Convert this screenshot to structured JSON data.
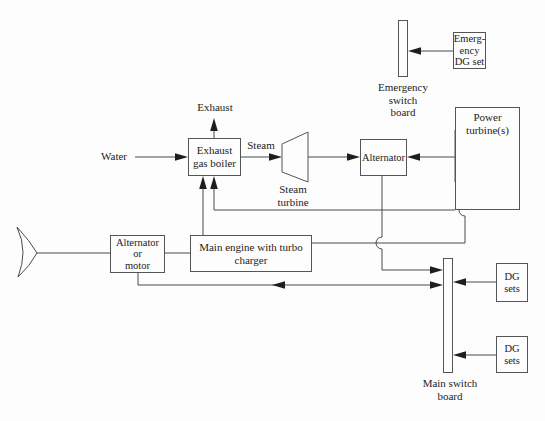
{
  "colors": {
    "bg": "#fdfdfd",
    "line": "#4a4a4a",
    "arrow": "#1e1e1e",
    "text": "#1c1c1c",
    "border": "#555555"
  },
  "nodes": {
    "emergency_dg_set": {
      "line1": "Emerg-",
      "line2": "ency",
      "line3": "DG set"
    },
    "emergency_switchboard_label": {
      "line1": "Emergency",
      "line2": "switch",
      "line3": "board"
    },
    "power_turbine": {
      "line1": "Power",
      "line2": "turbine(s)"
    },
    "exhaust_gas_boiler": {
      "line1": "Exhaust",
      "line2": "gas boiler"
    },
    "steam_turbine_label": {
      "line1": "Steam",
      "line2": "turbine"
    },
    "alternator": {
      "label": "Alternator"
    },
    "main_engine": {
      "line1": "Main engine with turbo",
      "line2": "charger"
    },
    "alternator_or_motor": {
      "line1": "Alternator",
      "line2": "or",
      "line3": "motor"
    },
    "main_switchboard_label": {
      "line1": "Main switch",
      "line2": "board"
    },
    "dg_sets_top": {
      "line1": "DG",
      "line2": "sets"
    },
    "dg_sets_bottom": {
      "line1": "DG",
      "line2": "sets"
    }
  },
  "flow_labels": {
    "exhaust": "Exhaust",
    "water": "Water",
    "steam": "Steam"
  }
}
